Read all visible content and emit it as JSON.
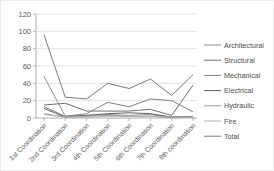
{
  "figure": {
    "background_color": "#ffffff",
    "gridline_color": "#d9d9d9",
    "axis_color": "#9a9a9a",
    "tick_text_color": "#595959"
  },
  "chart_data": {
    "type": "line",
    "title": "",
    "xlabel": "",
    "ylabel": "",
    "ylim": [
      0,
      120
    ],
    "ytick_step": 20,
    "ytick_labels": [
      "0",
      "20",
      "40",
      "60",
      "80",
      "100",
      "120"
    ],
    "grid": true,
    "legend_position": "right",
    "categories": [
      "1st Coordination",
      "2nd Coordination",
      "3rd Coordination",
      "4th Coordination",
      "5th Coordination",
      "6th Coordination",
      "7th Coordination",
      "8th coordination"
    ],
    "series": [
      {
        "name": "Architectural",
        "color": "#929292",
        "values": [
          48,
          2,
          3,
          4,
          3,
          4,
          1,
          2
        ]
      },
      {
        "name": "Structural",
        "color": "#6f6f6f",
        "values": [
          15,
          17,
          8,
          8,
          8,
          10,
          3,
          38
        ]
      },
      {
        "name": "Mechanical",
        "color": "#818181",
        "values": [
          13,
          2,
          5,
          18,
          13,
          22,
          20,
          7
        ]
      },
      {
        "name": "Electrical",
        "color": "#636363",
        "values": [
          11,
          1,
          3,
          5,
          6,
          5,
          1,
          1
        ]
      },
      {
        "name": "Hydraulic",
        "color": "#9e9e9e",
        "values": [
          5,
          1,
          2,
          3,
          2,
          2,
          1,
          1
        ]
      },
      {
        "name": "Fire",
        "color": "#b2b2b2",
        "values": [
          4,
          1,
          1,
          2,
          2,
          2,
          0,
          1
        ]
      },
      {
        "name": "Total",
        "color": "#7a7a7a",
        "values": [
          96,
          24,
          22,
          40,
          34,
          45,
          26,
          50
        ]
      }
    ]
  }
}
